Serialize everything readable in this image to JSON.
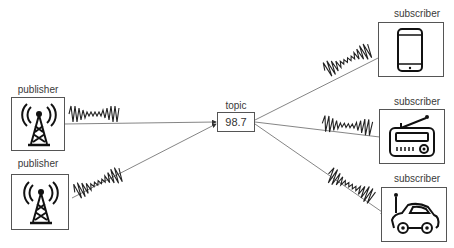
{
  "diagram": {
    "type": "publish-subscribe",
    "publishers": [
      {
        "label": "publisher",
        "icon": "radio-tower-icon"
      },
      {
        "label": "publisher",
        "icon": "radio-tower-icon"
      }
    ],
    "topic": {
      "label": "topic",
      "value": "98.7"
    },
    "subscribers": [
      {
        "label": "subscriber",
        "icon": "smartphone-icon"
      },
      {
        "label": "subscriber",
        "icon": "radio-icon"
      },
      {
        "label": "subscriber",
        "icon": "car-icon"
      }
    ],
    "colors": {
      "line": "#555555",
      "wave": "#222222",
      "icon": "#111111"
    }
  }
}
